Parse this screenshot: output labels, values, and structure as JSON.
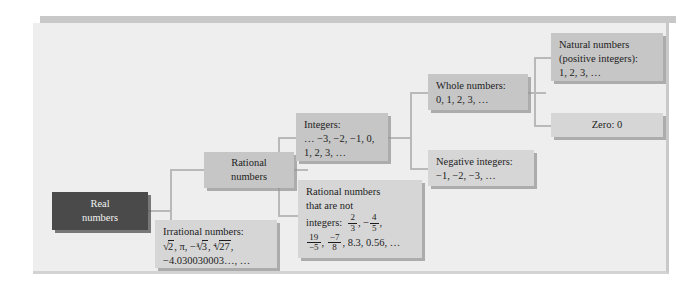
{
  "figure": {
    "type": "tree-diagram",
    "accent_color": "#c8c8c8",
    "panel_color": "#eeeeee",
    "box_color": "#c6c6c6",
    "root_box_color": "#4a4a4a",
    "connector_color": "#b9b9b9"
  },
  "nodes": {
    "real": {
      "line1": "Real",
      "line2": "numbers"
    },
    "rational": {
      "line1": "Rational",
      "line2": "numbers"
    },
    "irrational": {
      "label": "Irrational numbers:",
      "line2_prefix": "",
      "values_line2": "√2, π, −∛3, ∜27,",
      "values_line3": "−4.030030003…, …",
      "radical_sqrt2": "2",
      "radical_cbrt3_index": "3",
      "radical_cbrt3_arg": "3",
      "radical_4rt27_index": "4",
      "radical_4rt27_arg": "27",
      "pi": "π",
      "decimal": "−4.030030003…, …"
    },
    "integers": {
      "label": "Integers:",
      "line2": "… −3, −2, −1, 0,",
      "line3": "1, 2, 3, …"
    },
    "non_integer_rationals": {
      "line1": "Rational numbers",
      "line2": "that are not",
      "line3_label": "integers:",
      "frac1_num": "2",
      "frac1_den": "3",
      "frac1_sep": ", −",
      "frac2_num": "4",
      "frac2_den": "5",
      "frac2_sep": ",",
      "frac3_num": "19",
      "frac3_den": "−5",
      "frac3_sep": ",",
      "frac4_num": "−7",
      "frac4_den": "8",
      "tail": ", 8.3, 0.56, …"
    },
    "whole": {
      "label": "Whole numbers:",
      "values": "0, 1, 2, 3, …"
    },
    "negative_integers": {
      "label": "Negative integers:",
      "values": "−1, −2, −3, …"
    },
    "natural": {
      "line1": "Natural numbers",
      "line2": "(positive integers):",
      "line3": "1, 2, 3, …"
    },
    "zero": {
      "label": "Zero: 0"
    }
  }
}
